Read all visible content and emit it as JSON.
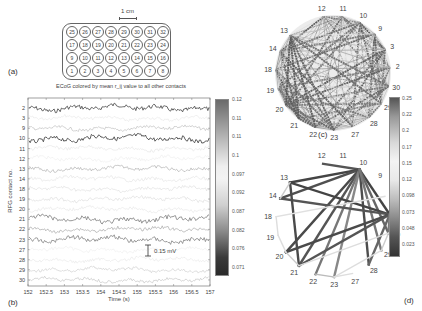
{
  "panel_a": {
    "label": "(a)",
    "scale_bar_label": "1 cm",
    "grid_rows": [
      [
        25,
        26,
        27,
        28,
        29,
        30,
        31,
        32
      ],
      [
        17,
        18,
        19,
        20,
        21,
        22,
        23,
        24
      ],
      [
        9,
        10,
        11,
        12,
        13,
        14,
        15,
        16
      ],
      [
        1,
        2,
        3,
        4,
        5,
        6,
        7,
        8
      ]
    ]
  },
  "panel_b": {
    "label": "(b)",
    "title": "ECoG colored by mean r_ij value to all other contacts",
    "xlabel": "Time (s)",
    "ylabel": "RFG contact no.",
    "xticks": [
      "152",
      "152.5",
      "153",
      "153.5",
      "154",
      "154.5",
      "155",
      "155.5",
      "156",
      "156.5",
      "157"
    ],
    "channels": [
      {
        "id": "2",
        "shade": "#555555"
      },
      {
        "id": "3",
        "shade": "#e6e6e6"
      },
      {
        "id": "9",
        "shade": "#b5b5b5"
      },
      {
        "id": "10",
        "shade": "#4a4a4a"
      },
      {
        "id": "11",
        "shade": "#e2e2e2"
      },
      {
        "id": "12",
        "shade": "#ececec"
      },
      {
        "id": "13",
        "shade": "#a5a5a5"
      },
      {
        "id": "14",
        "shade": "#e0e0e0"
      },
      {
        "id": "18",
        "shade": "#dcdcdc"
      },
      {
        "id": "19",
        "shade": "#d8d8d8"
      },
      {
        "id": "20",
        "shade": "#e4e4e4"
      },
      {
        "id": "21",
        "shade": "#8a8a8a"
      },
      {
        "id": "22",
        "shade": "#9a9a9a"
      },
      {
        "id": "23",
        "shade": "#8f8f8f"
      },
      {
        "id": "27",
        "shade": "#ececec"
      },
      {
        "id": "28",
        "shade": "#e6e6e6"
      },
      {
        "id": "29",
        "shade": "#c9c9c9"
      },
      {
        "id": "30",
        "shade": "#bdbdbd"
      }
    ],
    "scale_bar_label": "0.15 mV",
    "colorbar": {
      "ticks": [
        "0.12",
        "0.11",
        "0.11",
        "0.1",
        "0.097",
        "0.092",
        "0.087",
        "0.082",
        "0.076",
        "0.071"
      ]
    }
  },
  "panel_c": {
    "label": "(c)",
    "nodes": [
      "12",
      "11",
      "10",
      "9",
      "3",
      "2",
      "30",
      "29",
      "28",
      "27",
      "23",
      "22",
      "21",
      "20",
      "19",
      "18",
      "14",
      "13"
    ]
  },
  "panel_d": {
    "label": "(d)",
    "nodes": [
      "12",
      "11",
      "10",
      "9",
      "3",
      "2",
      "30",
      "29",
      "28",
      "27",
      "23",
      "22",
      "21",
      "20",
      "19",
      "18",
      "14",
      "13"
    ],
    "edges": [
      [
        "10",
        "12",
        "#555"
      ],
      [
        "10",
        "13",
        "#444"
      ],
      [
        "10",
        "14",
        "#505050"
      ],
      [
        "10",
        "20",
        "#4a4a4a"
      ],
      [
        "10",
        "21",
        "#555"
      ],
      [
        "10",
        "22",
        "#777"
      ],
      [
        "10",
        "23",
        "#888"
      ],
      [
        "10",
        "28",
        "#4d4d4d"
      ],
      [
        "10",
        "2",
        "#444"
      ],
      [
        "10",
        "30",
        "#666"
      ],
      [
        "10",
        "29",
        "#777"
      ],
      [
        "13",
        "2",
        "#444"
      ],
      [
        "14",
        "2",
        "#555"
      ],
      [
        "20",
        "2",
        "#4a4a4a"
      ],
      [
        "21",
        "2",
        "#555"
      ],
      [
        "13",
        "21",
        "#4a4a4a"
      ],
      [
        "2",
        "28",
        "#666"
      ],
      [
        "22",
        "23",
        "#bbb"
      ],
      [
        "20",
        "21",
        "#ccc"
      ],
      [
        "19",
        "20",
        "#ddd"
      ],
      [
        "18",
        "19",
        "#ddd"
      ],
      [
        "2",
        "30",
        "#777"
      ],
      [
        "30",
        "29",
        "#ccc"
      ],
      [
        "23",
        "27",
        "#ddd"
      ],
      [
        "14",
        "13",
        "#ccc"
      ],
      [
        "18",
        "3",
        "#e0e0e0"
      ],
      [
        "21",
        "30",
        "#ddd"
      ],
      [
        "23",
        "29",
        "#ddd"
      ]
    ]
  },
  "colorbar_cd": {
    "ticks": [
      "0.25",
      "0.22",
      "0.2",
      "0.17",
      "0.15",
      "0.12",
      "0.098",
      "0.073",
      "0.048",
      "0.023"
    ]
  }
}
